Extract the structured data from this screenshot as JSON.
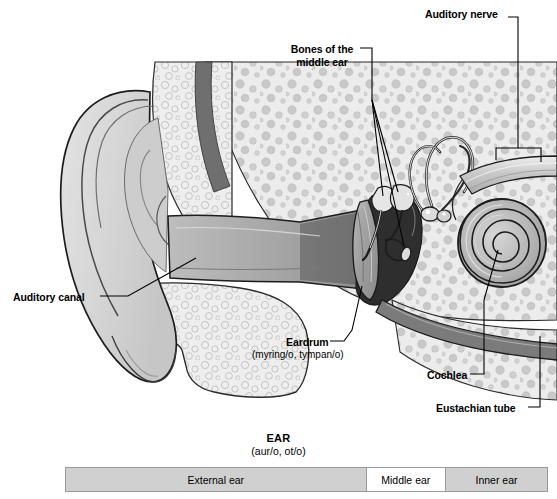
{
  "figure": {
    "title": "EAR",
    "subtitle": "(aur/o, ot/o)"
  },
  "callouts": {
    "auditory_nerve": "Auditory nerve",
    "bones_of_middle_ear": "Bones of the middle ear",
    "auditory_canal": "Auditory canal",
    "eardrum": "Eardrum",
    "eardrum_terms": "(myring/o, tympan/o)",
    "cochlea": "Cochlea",
    "eustachian_tube": "Eustachian tube"
  },
  "region_bar": {
    "cells": [
      {
        "label": "External ear",
        "shaded": true
      },
      {
        "label": "Middle ear",
        "shaded": false
      },
      {
        "label": "Inner ear",
        "shaded": true
      }
    ]
  },
  "colors": {
    "outline": "#1a1a1a",
    "bone_fill": "#ebebeb",
    "bone_speckle": "#c3c3c3",
    "cartilage_fill": "#d9d9d9",
    "skin_band": "#6f6f6f",
    "canal_dark": "#2e2e2e",
    "eardrum_fill": "#9a9a9a",
    "cochlea_fill": "#b5b5b5",
    "bar_shaded": "#d0d0d0",
    "bar_light": "#ffffff",
    "bar_border": "#9a9a9a"
  }
}
